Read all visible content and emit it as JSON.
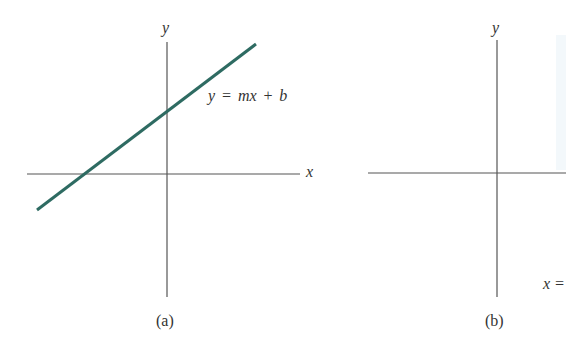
{
  "panels": [
    {
      "id": "a",
      "caption": "(a)",
      "x_axis_label": "x",
      "y_axis_label": "y",
      "line_label": "y = mx + b",
      "line_color": "#2e6b62",
      "line": {
        "x1": 37,
        "y1": 210,
        "x2": 256,
        "y2": 44
      },
      "axes": {
        "origin_x": 167,
        "origin_y": 174,
        "x_from": 27,
        "x_to": 300,
        "y_from": 42,
        "y_to": 297
      }
    },
    {
      "id": "b",
      "caption": "(b)",
      "y_axis_label": "y",
      "partial_label": "x =",
      "axes": {
        "origin_x": 497,
        "origin_y": 173,
        "x_from": 368,
        "x_to": 566,
        "y_from": 40,
        "y_to": 297
      }
    }
  ],
  "colors": {
    "axis": "#555555",
    "text": "#333333",
    "background": "#ffffff"
  }
}
